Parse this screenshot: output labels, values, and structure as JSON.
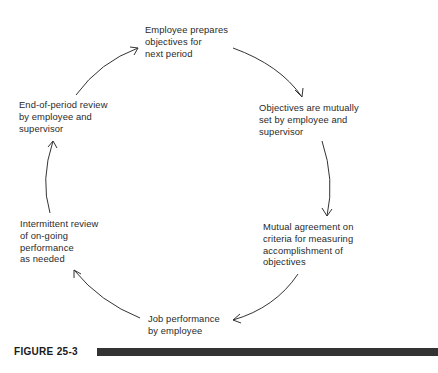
{
  "diagram": {
    "type": "cycle",
    "nodes": [
      {
        "id": "prepare",
        "text": "Employee prepares\nobjectives for\nnext period"
      },
      {
        "id": "set",
        "text": "Objectives are mutually\nset by employee and\nsupervisor"
      },
      {
        "id": "criteria",
        "text": "Mutual agreement on\ncriteria for measuring\naccomplishment of\nobjectives"
      },
      {
        "id": "performance",
        "text": "Job performance\nby employee"
      },
      {
        "id": "intermittent",
        "text": "Intermittent review\nof on-going\nperformance\nas needed"
      },
      {
        "id": "endreview",
        "text": "End-of-period review\nby employee and\nsupervisor"
      }
    ],
    "edges": [
      {
        "from": "prepare",
        "to": "set"
      },
      {
        "from": "set",
        "to": "criteria"
      },
      {
        "from": "criteria",
        "to": "performance"
      },
      {
        "from": "performance",
        "to": "intermittent"
      },
      {
        "from": "intermittent",
        "to": "endreview"
      },
      {
        "from": "endreview",
        "to": "prepare"
      }
    ]
  },
  "figure": {
    "label": "FIGURE 25-3"
  },
  "colors": {
    "text": "#2a2a2a",
    "bar": "#333333"
  }
}
